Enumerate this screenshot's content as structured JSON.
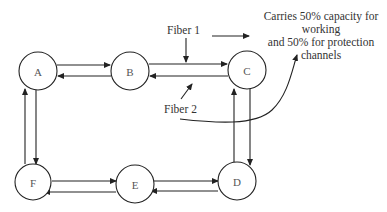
{
  "diagram": {
    "type": "bidirectional ring network",
    "nodes": [
      {
        "id": "A",
        "label": "A",
        "cx": 38,
        "cy": 71
      },
      {
        "id": "B",
        "label": "B",
        "cx": 130,
        "cy": 71
      },
      {
        "id": "C",
        "label": "C",
        "cx": 247,
        "cy": 70
      },
      {
        "id": "D",
        "label": "D",
        "cx": 237,
        "cy": 181
      },
      {
        "id": "E",
        "label": "E",
        "cx": 135,
        "cy": 184
      },
      {
        "id": "F",
        "label": "F",
        "cx": 33,
        "cy": 182
      }
    ],
    "links": [
      {
        "from": "A",
        "to": "B",
        "fiber": "Fiber 1"
      },
      {
        "from": "B",
        "to": "A",
        "fiber": "Fiber 2"
      },
      {
        "from": "B",
        "to": "C",
        "fiber": "Fiber 1"
      },
      {
        "from": "C",
        "to": "B",
        "fiber": "Fiber 2"
      },
      {
        "from": "C",
        "to": "D",
        "fiber": "Fiber 1"
      },
      {
        "from": "D",
        "to": "C",
        "fiber": "Fiber 2"
      },
      {
        "from": "F",
        "to": "E",
        "fiber": "Fiber 1"
      },
      {
        "from": "E",
        "to": "F",
        "fiber": "Fiber 2"
      },
      {
        "from": "E",
        "to": "D",
        "fiber": "Fiber 1"
      },
      {
        "from": "D",
        "to": "E",
        "fiber": "Fiber 2"
      },
      {
        "from": "A",
        "to": "F",
        "fiber": "Fiber 1"
      },
      {
        "from": "F",
        "to": "A",
        "fiber": "Fiber 2"
      }
    ],
    "labels": {
      "fiber1": "Fiber 1",
      "fiber2": "Fiber 2"
    },
    "annotation": {
      "lines": [
        "Carries 50% capacity for",
        "working",
        "and 50% for protection",
        "channels"
      ]
    },
    "colors": {
      "stroke": "#222222",
      "text": "#333333",
      "background": "#ffffff"
    }
  }
}
